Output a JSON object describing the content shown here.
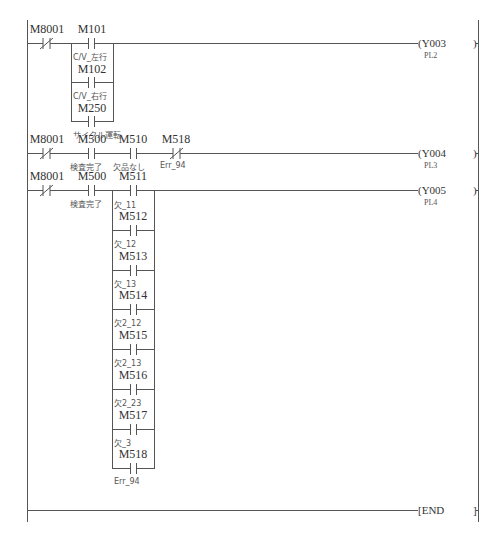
{
  "diagram": {
    "type": "ladder",
    "rungs": [
      {
        "series": [
          {
            "device": "M8001",
            "type": "NC",
            "comment": ""
          }
        ],
        "parallel_branch": [
          {
            "device": "M101",
            "type": "NO",
            "comment": "C/V_左行"
          },
          {
            "device": "M102",
            "type": "NO",
            "comment": "C/V_右行"
          },
          {
            "device": "M250",
            "type": "NO",
            "comment": "サイクル運転"
          }
        ],
        "coil": {
          "device": "Y003",
          "comment": "PL2"
        }
      },
      {
        "series": [
          {
            "device": "M8001",
            "type": "NC",
            "comment": ""
          },
          {
            "device": "M500",
            "type": "NO",
            "comment": "検査完了"
          },
          {
            "device": "M510",
            "type": "NO",
            "comment": "欠品なし"
          },
          {
            "device": "M518",
            "type": "NC",
            "comment": "Err_94"
          }
        ],
        "coil": {
          "device": "Y004",
          "comment": "PL3"
        }
      },
      {
        "series": [
          {
            "device": "M8001",
            "type": "NC",
            "comment": ""
          },
          {
            "device": "M500",
            "type": "NO",
            "comment": "検査完了"
          }
        ],
        "parallel_branch": [
          {
            "device": "M511",
            "type": "NO",
            "comment": "欠_11"
          },
          {
            "device": "M512",
            "type": "NO",
            "comment": "欠_12"
          },
          {
            "device": "M513",
            "type": "NO",
            "comment": "欠_13"
          },
          {
            "device": "M514",
            "type": "NO",
            "comment": "欠2_12"
          },
          {
            "device": "M515",
            "type": "NO",
            "comment": "欠2_13"
          },
          {
            "device": "M516",
            "type": "NO",
            "comment": "欠2_23"
          },
          {
            "device": "M517",
            "type": "NO",
            "comment": "欠_3"
          },
          {
            "device": "M518",
            "type": "NO",
            "comment": "Err_94"
          }
        ],
        "coil": {
          "device": "Y005",
          "comment": "PL4"
        }
      },
      {
        "instruction": "END"
      }
    ]
  },
  "labels": {
    "r1": {
      "c1": "M8001",
      "b1": "M101",
      "b1c": "C/V_左行",
      "b2": "M102",
      "b2c": "C/V_右行",
      "b3": "M250",
      "b3c": "サイクル運転",
      "coil": "(Y003",
      "coilc": "PL2",
      "close": ")"
    },
    "r2": {
      "c1": "M8001",
      "c2": "M500",
      "c2c": "検査完了",
      "c3": "M510",
      "c3c": "欠品なし",
      "c4": "M518",
      "c4c": "Err_94",
      "coil": "(Y004",
      "coilc": "PL3",
      "close": ")"
    },
    "r3": {
      "c1": "M8001",
      "c2": "M500",
      "c2c": "検査完了",
      "b1": "M511",
      "b1c": "欠_11",
      "b2": "M512",
      "b2c": "欠_12",
      "b3": "M513",
      "b3c": "欠_13",
      "b4": "M514",
      "b4c": "欠2_12",
      "b5": "M515",
      "b5c": "欠2_13",
      "b6": "M516",
      "b6c": "欠2_23",
      "b7": "M517",
      "b7c": "欠_3",
      "b8": "M518",
      "b8c": "Err_94",
      "coil": "(Y005",
      "coilc": "PL4",
      "close": ")"
    },
    "end": {
      "label": "[END",
      "close": "]"
    }
  }
}
